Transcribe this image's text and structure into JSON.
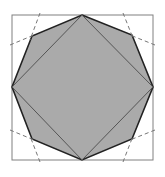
{
  "diagram": {
    "colors": {
      "background": "#ffffff",
      "square_stroke": "#808080",
      "octagon_fill": "#aaaaaa",
      "octagon_stroke": "#222222",
      "inner_square_stroke": "#555555",
      "dashed_stroke": "#777777"
    },
    "outer_square": {
      "x": 12,
      "y": 15,
      "w": 141,
      "h": 145
    },
    "octagon_points": "82,15 132,35 153,87 132,139 82,160 32,139 12,87 32,36",
    "inner_square_points": "82,15 153,87 82,160 12,87",
    "dashed_lines": [
      {
        "x1": 40,
        "y1": 13,
        "x2": 30,
        "y2": 40
      },
      {
        "x1": 10,
        "y1": 45,
        "x2": 34,
        "y2": 35
      },
      {
        "x1": 123,
        "y1": 13,
        "x2": 133,
        "y2": 38
      },
      {
        "x1": 155,
        "y1": 45,
        "x2": 130,
        "y2": 35
      },
      {
        "x1": 40,
        "y1": 162,
        "x2": 30,
        "y2": 136
      },
      {
        "x1": 10,
        "y1": 130,
        "x2": 34,
        "y2": 140
      },
      {
        "x1": 123,
        "y1": 162,
        "x2": 133,
        "y2": 136
      },
      {
        "x1": 155,
        "y1": 130,
        "x2": 130,
        "y2": 140
      }
    ]
  }
}
